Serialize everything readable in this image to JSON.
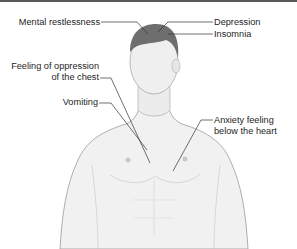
{
  "diagram": {
    "colors": {
      "line": "#333333",
      "hair": "#6e6e6e",
      "skin": "#f1f1f1",
      "outline": "#9a9a9a",
      "topbar": "#5a5a5a"
    },
    "labels": [
      {
        "id": "mental-restlessness",
        "lines": [
          "Mental restlessness"
        ]
      },
      {
        "id": "depression",
        "lines": [
          "Depression"
        ]
      },
      {
        "id": "insomnia",
        "lines": [
          "Insomnia"
        ]
      },
      {
        "id": "chest-oppression",
        "lines": [
          "Feeling of oppression",
          "of the chest"
        ]
      },
      {
        "id": "vomiting",
        "lines": [
          "Vomiting"
        ]
      },
      {
        "id": "anxiety-below-heart",
        "lines": [
          "Anxiety feeling",
          "below the heart"
        ]
      }
    ]
  }
}
